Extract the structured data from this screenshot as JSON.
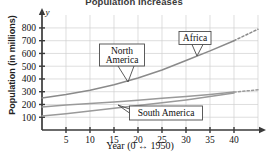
{
  "chart_data": {
    "type": "line",
    "title": "Population Increases",
    "xlabel": "Year (0 ↔ 1950)",
    "ylabel": "Population (in millions)",
    "xlim": [
      0,
      45
    ],
    "ylim": [
      0,
      870
    ],
    "xticks": [
      "5",
      "10",
      "15",
      "20",
      "25",
      "30",
      "35",
      "40"
    ],
    "xtick_values": [
      5,
      10,
      15,
      20,
      25,
      30,
      35,
      40
    ],
    "yticks": [
      "100",
      "200",
      "300",
      "400",
      "500",
      "600",
      "700",
      "800"
    ],
    "ytick_values": [
      100,
      200,
      300,
      400,
      500,
      600,
      700,
      800
    ],
    "grid": true,
    "legend": "callout-labels",
    "axis_letter_y": "y",
    "x": [
      0,
      5,
      10,
      15,
      20,
      25,
      30,
      35,
      40
    ],
    "series": [
      {
        "name": "Africa",
        "values": [
          250,
          278,
          312,
          355,
          408,
          470,
          545,
          620,
          700
        ],
        "color": "#8a8a8a",
        "dashed_extension": {
          "x": [
            40,
            45
          ],
          "values": [
            700,
            790
          ]
        }
      },
      {
        "name": "North America",
        "values": [
          180,
          195,
          208,
          220,
          233,
          248,
          262,
          278,
          297
        ],
        "color": "#9a9a9a",
        "dashed_extension": {
          "x": [
            40,
            45
          ],
          "values": [
            297,
            315
          ]
        }
      },
      {
        "name": "South America",
        "values": [
          110,
          128,
          148,
          170,
          192,
          213,
          236,
          262,
          290
        ],
        "color": "#9a9a9a",
        "dashed_extension": null
      }
    ],
    "annotations": [
      {
        "label": "North\nAmerica",
        "line1": "North",
        "line2": "America",
        "points_to": "North America"
      },
      {
        "label": "Africa",
        "line1": "Africa",
        "line2": "",
        "points_to": "Africa"
      },
      {
        "label": "South America",
        "line1": "South America",
        "line2": "",
        "points_to": "South America"
      }
    ]
  }
}
